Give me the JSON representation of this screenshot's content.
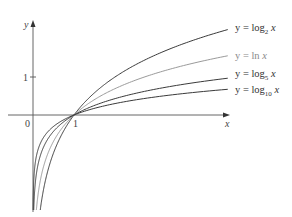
{
  "chart_data": {
    "type": "line",
    "title": "",
    "xlabel": "x",
    "ylabel": "y",
    "origin_label": "0",
    "x_ticks": [
      {
        "value": 1,
        "label": "1"
      }
    ],
    "y_ticks": [
      {
        "value": 1,
        "label": "1"
      }
    ],
    "xlim": [
      -0.6,
      4.75
    ],
    "ylim": [
      -2.5,
      2.45
    ],
    "grid": false,
    "legend_position": "inline-right",
    "series": [
      {
        "name": "y = log2 x",
        "base": 2,
        "color": "#3a3a3a",
        "label_main": "y = log",
        "label_sub": "2",
        "label_var": " x",
        "label_y": 31
      },
      {
        "name": "y = ln x",
        "base": 2.718281828,
        "color": "#9a9a9a",
        "label_main": "y = ln",
        "label_sub": "",
        "label_var": " x",
        "label_y": 59
      },
      {
        "name": "y = log5 x",
        "base": 5,
        "color": "#3a3a3a",
        "label_main": "y = log",
        "label_sub": "5",
        "label_var": " x",
        "label_y": 77
      },
      {
        "name": "y = log10 x",
        "base": 10,
        "color": "#3a3a3a",
        "label_main": "y = log",
        "label_sub": "10",
        "label_var": " x",
        "label_y": 93
      }
    ]
  }
}
